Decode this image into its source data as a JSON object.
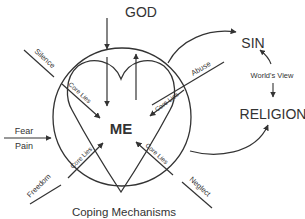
{
  "diagram": {
    "top_label": "GOD",
    "center_label": "ME",
    "bottom_label": "Coping Mechanisms",
    "right_top_label": "SIN",
    "right_middle_label": "World's View",
    "right_bottom_label": "RELIGION",
    "left_input_top": "Fear",
    "left_input_bottom": "Pain",
    "outer_spokes": {
      "upper_left": "Silence",
      "upper_right": "Abuse",
      "lower_left": "Freedom",
      "lower_right": "Neglect"
    },
    "inner_spokes": {
      "upper_left": "Core Lies",
      "upper_right": "Core Lies",
      "lower_left": "Core Lies",
      "lower_right": "Core Lies"
    },
    "colors": {
      "stroke": "#333333",
      "text": "#333333",
      "background": "#ffffff"
    }
  }
}
